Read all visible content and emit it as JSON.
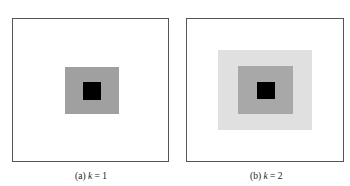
{
  "figure": {
    "panels": [
      {
        "id": "a",
        "caption_label": "(a)",
        "caption_var": "k",
        "caption_eq": " = 1",
        "layers": [
          {
            "name": "mid-gray",
            "color": "#a0a0a0"
          },
          {
            "name": "black-center",
            "color": "#000000"
          }
        ]
      },
      {
        "id": "b",
        "caption_label": "(b)",
        "caption_var": "k",
        "caption_eq": " = 2",
        "layers": [
          {
            "name": "light-gray",
            "color": "#e0e0e0"
          },
          {
            "name": "mid-gray",
            "color": "#a8a8a8"
          },
          {
            "name": "black-center",
            "color": "#000000"
          }
        ]
      }
    ]
  }
}
